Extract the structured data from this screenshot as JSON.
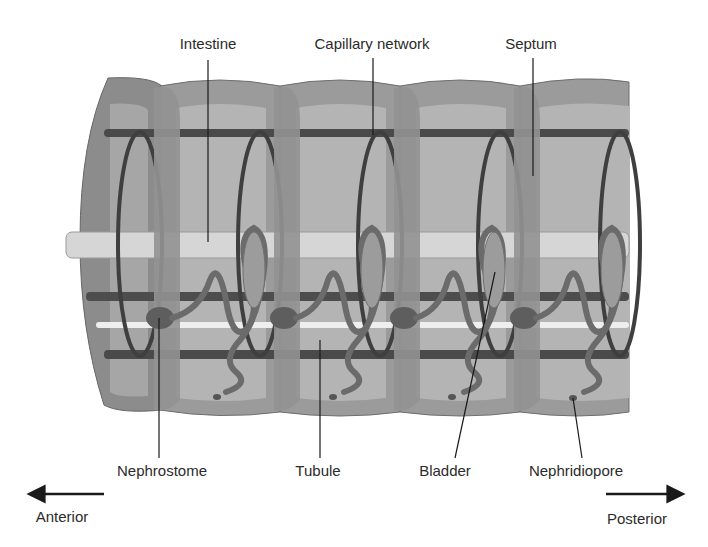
{
  "diagram": {
    "labels": {
      "intestine": "Intestine",
      "capillary_network": "Capillary network",
      "septum": "Septum",
      "nephrostome": "Nephrostome",
      "tubule": "Tubule",
      "bladder": "Bladder",
      "nephridiopore": "Nephridiopore"
    },
    "directions": {
      "anterior": "Anterior",
      "posterior": "Posterior"
    },
    "colors": {
      "body_outer": "#8a8a8a",
      "body_inner": "#a9a9a9",
      "lumen": "#bdbdbd",
      "intestine": "#d6d6d6",
      "vessel": "#4a4a4a",
      "nephridium": "#707070",
      "bladder": "#9a9a9a",
      "text": "#2b2b2b"
    }
  }
}
